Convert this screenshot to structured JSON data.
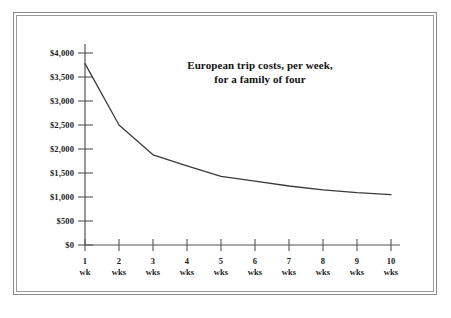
{
  "chart_data": {
    "type": "line",
    "title": "European trip costs, per week, for a family of four",
    "title_lines": [
      "European trip costs, per week,",
      "for a family of four"
    ],
    "xlabel": "",
    "ylabel": "",
    "categories": [
      "1 wk",
      "2 wks",
      "3 wks",
      "4 wks",
      "5 wks",
      "6 wks",
      "7 wks",
      "8 wks",
      "9 wks",
      "10 wks"
    ],
    "x_tick_numbers": [
      "1",
      "2",
      "3",
      "4",
      "5",
      "6",
      "7",
      "8",
      "9",
      "10"
    ],
    "x_tick_units": [
      "wk",
      "wks",
      "wks",
      "wks",
      "wks",
      "wks",
      "wks",
      "wks",
      "wks",
      "wks"
    ],
    "x": [
      1,
      2,
      3,
      4,
      5,
      6,
      7,
      8,
      9,
      10
    ],
    "values": [
      3780,
      2500,
      1880,
      1650,
      1430,
      1330,
      1230,
      1150,
      1090,
      1050
    ],
    "y_tick_values": [
      0,
      500,
      1000,
      1500,
      2000,
      2500,
      3000,
      3500,
      4000
    ],
    "y_tick_labels": [
      "$0",
      "$500",
      "$1,000",
      "$1,500",
      "$2,000",
      "$2,500",
      "$3,000",
      "$3,500",
      "$4,000"
    ],
    "ylim": [
      0,
      4250
    ],
    "xlim": [
      0.6,
      10.4
    ],
    "grid": false,
    "legend": false,
    "series_color": "#3a3a3a",
    "axis_color": "#555555"
  },
  "frame": {
    "border_color": "#8a8a8a",
    "background": "#ffffff"
  }
}
